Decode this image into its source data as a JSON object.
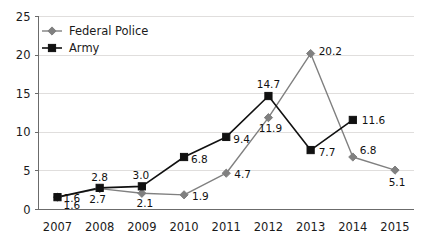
{
  "chart_data": {
    "type": "line",
    "title": "",
    "subtitle": "",
    "xlabel": "",
    "ylabel": "",
    "categories": [
      "2007",
      "2008",
      "2009",
      "2010",
      "2011",
      "2012",
      "2013",
      "2014",
      "2015"
    ],
    "ylim": [
      0,
      25
    ],
    "yticks": [
      0,
      5,
      10,
      15,
      20,
      25
    ],
    "ytick_labels": [
      "0",
      "5",
      "10",
      "15",
      "20",
      "25"
    ],
    "grid": true,
    "legend_position": "top-left",
    "series": [
      {
        "name": "Federal Police",
        "color": "#808080",
        "marker": "diamond",
        "values": [
          1.6,
          2.7,
          2.1,
          1.9,
          4.7,
          11.9,
          20.2,
          6.8,
          5.1
        ],
        "labels": [
          "1.6",
          "2.7",
          "2.1",
          "1.9",
          "4.7",
          "11.9",
          "20.2",
          "6.8",
          "5.1"
        ]
      },
      {
        "name": "Army",
        "color": "#111111",
        "marker": "square",
        "values": [
          1.6,
          2.8,
          3.0,
          6.8,
          9.4,
          14.7,
          7.7,
          11.6,
          null
        ],
        "labels": [
          "1.6",
          "2.8",
          "3.0",
          "6.8",
          "9.4",
          "14.7",
          "7.7",
          "11.6",
          ""
        ]
      }
    ],
    "annotations": [
      {
        "series": "Army",
        "category": "2007",
        "text": "1.6"
      },
      {
        "series": "Army",
        "category": "2008",
        "text": "2.8"
      },
      {
        "series": "Federal Police",
        "category": "2008",
        "text": "2.7"
      },
      {
        "series": "Army",
        "category": "2009",
        "text": "3.0"
      },
      {
        "series": "Federal Police",
        "category": "2009",
        "text": "2.1"
      },
      {
        "series": "Army",
        "category": "2010",
        "text": "6.8"
      },
      {
        "series": "Federal Police",
        "category": "2010",
        "text": "1.9"
      },
      {
        "series": "Army",
        "category": "2011",
        "text": "9.4"
      },
      {
        "series": "Federal Police",
        "category": "2011",
        "text": "4.7"
      },
      {
        "series": "Army",
        "category": "2012",
        "text": "14.7"
      },
      {
        "series": "Federal Police",
        "category": "2012",
        "text": "11.9"
      },
      {
        "series": "Federal Police",
        "category": "2013",
        "text": "20.2"
      },
      {
        "series": "Army",
        "category": "2013",
        "text": "7.7"
      },
      {
        "series": "Army",
        "category": "2014",
        "text": "11.6"
      },
      {
        "series": "Federal Police",
        "category": "2014",
        "text": "6.8"
      },
      {
        "series": "Federal Police",
        "category": "2015",
        "text": "5.1"
      }
    ]
  },
  "legend": {
    "items": [
      {
        "label": "Federal Police",
        "color": "#808080",
        "marker": "diamond"
      },
      {
        "label": "Army",
        "color": "#111111",
        "marker": "square"
      }
    ]
  },
  "label_offsets": [
    {
      "series": 1,
      "index": 0,
      "dx": 6,
      "dy": 12,
      "anchor": "start"
    },
    {
      "series": 1,
      "index": 1,
      "dx": 0,
      "dy": -7,
      "anchor": "middle"
    },
    {
      "series": 0,
      "index": 1,
      "dx": -2,
      "dy": 14,
      "anchor": "middle"
    },
    {
      "series": 1,
      "index": 2,
      "dx": -1,
      "dy": -7,
      "anchor": "middle"
    },
    {
      "series": 0,
      "index": 2,
      "dx": 3,
      "dy": 14,
      "anchor": "middle"
    },
    {
      "series": 1,
      "index": 3,
      "dx": 7,
      "dy": 6,
      "anchor": "start"
    },
    {
      "series": 0,
      "index": 3,
      "dx": 8,
      "dy": 5,
      "anchor": "start"
    },
    {
      "series": 1,
      "index": 4,
      "dx": 7,
      "dy": 6,
      "anchor": "start"
    },
    {
      "series": 0,
      "index": 4,
      "dx": 8,
      "dy": 5,
      "anchor": "start"
    },
    {
      "series": 1,
      "index": 5,
      "dx": 0,
      "dy": -8,
      "anchor": "middle"
    },
    {
      "series": 0,
      "index": 5,
      "dx": 2,
      "dy": 14,
      "anchor": "middle"
    },
    {
      "series": 0,
      "index": 6,
      "dx": 8,
      "dy": 1,
      "anchor": "start"
    },
    {
      "series": 1,
      "index": 6,
      "dx": 8,
      "dy": 6,
      "anchor": "start"
    },
    {
      "series": 1,
      "index": 7,
      "dx": 9,
      "dy": 4,
      "anchor": "start"
    },
    {
      "series": 0,
      "index": 7,
      "dx": 7,
      "dy": -3,
      "anchor": "start"
    },
    {
      "series": 0,
      "index": 8,
      "dx": 2,
      "dy": 16,
      "anchor": "middle"
    }
  ]
}
